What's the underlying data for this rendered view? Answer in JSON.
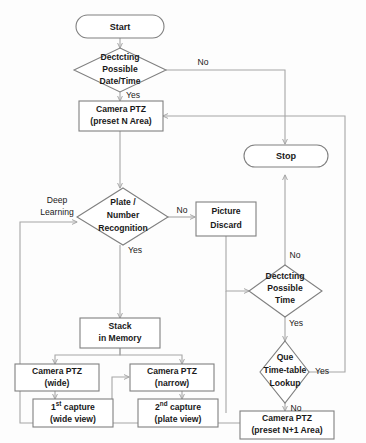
{
  "diagram": {
    "type": "flowchart",
    "colors": {
      "node_stroke": "#808080",
      "connector_stroke": "#a6a6a6",
      "node_fill": "#ffffff",
      "text": "#1a1a1a",
      "background": "#fdfdfd"
    },
    "nodes": [
      {
        "id": "start",
        "shape": "terminator",
        "lines": [
          "Start"
        ]
      },
      {
        "id": "det_datetime",
        "shape": "decision",
        "lines": [
          "Dectcting",
          "Possible",
          "Date/Time"
        ]
      },
      {
        "id": "ptz_n",
        "shape": "process",
        "lines": [
          "Camera PTZ",
          "(preset N Area)"
        ]
      },
      {
        "id": "plate_rec",
        "shape": "decision",
        "lines": [
          "Plate /",
          "Number",
          "Recognition"
        ]
      },
      {
        "id": "pic_discard",
        "shape": "process",
        "lines": [
          "Picture",
          "Discard"
        ]
      },
      {
        "id": "stop",
        "shape": "terminator",
        "lines": [
          "Stop"
        ]
      },
      {
        "id": "stack_mem",
        "shape": "process",
        "lines": [
          "Stack",
          "in Memory"
        ]
      },
      {
        "id": "ptz_wide",
        "shape": "process",
        "lines": [
          "Camera PTZ",
          "(wide)"
        ]
      },
      {
        "id": "ptz_narrow",
        "shape": "process",
        "lines": [
          "Camera PTZ",
          "(narrow)"
        ]
      },
      {
        "id": "cap1",
        "shape": "process",
        "lines": [
          "1st capture",
          "(wide view)"
        ],
        "sup": "st"
      },
      {
        "id": "cap2",
        "shape": "process",
        "lines": [
          "2nd capture",
          "(plate view)"
        ],
        "sup": "nd"
      },
      {
        "id": "det_time",
        "shape": "decision",
        "lines": [
          "Dectcting",
          "Possible",
          "Time"
        ]
      },
      {
        "id": "que_lookup",
        "shape": "decision",
        "lines": [
          "Que",
          "Time-table",
          "Lookup"
        ]
      },
      {
        "id": "ptz_n1",
        "shape": "process",
        "lines": [
          "Camera PTZ",
          "(preset N+1 Area)"
        ]
      }
    ],
    "labels": {
      "start": "Start",
      "det_datetime_1": "Dectcting",
      "det_datetime_2": "Possible",
      "det_datetime_3": "Date/Time",
      "ptz_n_1": "Camera PTZ",
      "ptz_n_2": "(preset N Area)",
      "plate_rec_1": "Plate /",
      "plate_rec_2": "Number",
      "plate_rec_3": "Recognition",
      "pic_discard_1": "Picture",
      "pic_discard_2": "Discard",
      "stop": "Stop",
      "stack_mem_1": "Stack",
      "stack_mem_2": "in Memory",
      "ptz_wide_1": "Camera PTZ",
      "ptz_wide_2": "(wide)",
      "ptz_narrow_1": "Camera PTZ",
      "ptz_narrow_2": "(narrow)",
      "cap1_num": "1",
      "cap1_sup": "st",
      "cap1_rest": " capture",
      "cap1_2": "(wide view)",
      "cap2_num": "2",
      "cap2_sup": "nd",
      "cap2_rest": " capture",
      "cap2_2": "(plate view)",
      "det_time_1": "Dectcting",
      "det_time_2": "Possible",
      "det_time_3": "Time",
      "que_lookup_1": "Que",
      "que_lookup_2": "Time-table",
      "que_lookup_3": "Lookup",
      "ptz_n1_1": "Camera PTZ",
      "ptz_n1_2": "(preset N+1 Area)"
    },
    "edge_labels": {
      "datetime_no": "No",
      "datetime_yes": "Yes",
      "deep_learning_1": "Deep",
      "deep_learning_2": "Learning",
      "plate_no": "No",
      "plate_yes": "Yes",
      "time_no": "No",
      "time_yes": "Yes",
      "que_yes": "Yes",
      "que_no": "No"
    },
    "edges": [
      {
        "from": "start",
        "to": "det_datetime",
        "label": ""
      },
      {
        "from": "det_datetime",
        "to": "stop",
        "label": "No"
      },
      {
        "from": "det_datetime",
        "to": "ptz_n",
        "label": "Yes"
      },
      {
        "from": "ptz_n",
        "to": "plate_rec",
        "label": ""
      },
      {
        "from": "plate_rec",
        "to": "pic_discard",
        "label": "No"
      },
      {
        "from": "plate_rec",
        "to": "stack_mem",
        "label": "Yes"
      },
      {
        "from": "pic_discard",
        "to": "det_time",
        "label": ""
      },
      {
        "from": "stack_mem",
        "to": "ptz_wide",
        "label": ""
      },
      {
        "from": "stack_mem",
        "to": "ptz_narrow",
        "label": ""
      },
      {
        "from": "ptz_wide",
        "to": "cap1",
        "label": ""
      },
      {
        "from": "cap1",
        "to": "ptz_narrow",
        "label": ""
      },
      {
        "from": "ptz_narrow",
        "to": "cap2",
        "label": ""
      },
      {
        "from": "cap2",
        "to": "det_time",
        "label": ""
      },
      {
        "from": "cap2",
        "to": "plate_rec",
        "label": "Deep Learning"
      },
      {
        "from": "det_time",
        "to": "stop",
        "label": "No"
      },
      {
        "from": "det_time",
        "to": "que_lookup",
        "label": "Yes"
      },
      {
        "from": "que_lookup",
        "to": "ptz_n",
        "label": "Yes"
      },
      {
        "from": "que_lookup",
        "to": "ptz_n1",
        "label": "No"
      },
      {
        "from": "ptz_n1",
        "to": "plate_rec",
        "label": ""
      }
    ]
  }
}
